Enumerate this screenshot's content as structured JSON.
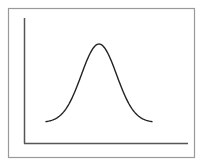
{
  "chart_data": {
    "type": "line",
    "title": "",
    "xlabel": "",
    "ylabel": "",
    "grid": false,
    "legend": null,
    "series": [
      {
        "name": "bell-curve",
        "mean": 0,
        "std": 1,
        "x": [
          -3,
          -2.5,
          -2,
          -1.5,
          -1,
          -0.5,
          0,
          0.5,
          1,
          1.5,
          2,
          2.5,
          3
        ],
        "values": [
          0.004,
          0.018,
          0.054,
          0.13,
          0.242,
          0.352,
          0.399,
          0.352,
          0.242,
          0.13,
          0.054,
          0.018,
          0.004
        ]
      }
    ],
    "xlim": [
      -3.2,
      3.2
    ],
    "ylim": [
      0,
      0.42
    ]
  },
  "colors": {
    "frame": "#9a9a9a",
    "axes": "#555555",
    "curve": "#222222",
    "background": "#ffffff"
  }
}
